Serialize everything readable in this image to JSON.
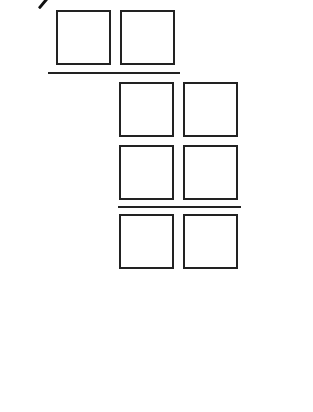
{
  "diagram": {
    "stroke_color": "#222222",
    "background": "#ffffff",
    "rows": [
      {
        "name": "top-row",
        "boxes": 2
      },
      {
        "name": "middle-row-1",
        "boxes": 2
      },
      {
        "name": "middle-row-2",
        "boxes": 2
      },
      {
        "name": "bottom-row",
        "boxes": 2
      }
    ],
    "rules": 2
  }
}
